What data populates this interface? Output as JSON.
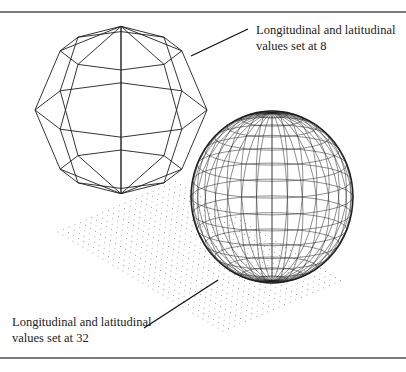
{
  "figure": {
    "rules": {
      "color": "#7d7d7d"
    },
    "callouts": [
      {
        "id": "low-res",
        "lines": [
          "Longitudinal and latitudinal",
          "values set at 8"
        ],
        "leader": {
          "x1": 191,
          "y1": 56,
          "x2": 248,
          "y2": 29
        }
      },
      {
        "id": "high-res",
        "lines": [
          "Longitudinal and latitudinal",
          "values set at 32"
        ],
        "leader": {
          "x1": 144,
          "y1": 328,
          "x2": 218,
          "y2": 280
        }
      }
    ],
    "spheres": [
      {
        "id": "sphere-8",
        "segments": 8,
        "cx": 121,
        "cy": 110,
        "rx": 86,
        "ry": 88,
        "tilt_deg": 18,
        "stroke": "#1e1e1e",
        "width": 0.9
      },
      {
        "id": "sphere-32",
        "segments": 32,
        "cx": 272,
        "cy": 197,
        "rx": 81,
        "ry": 86,
        "tilt_deg": 12,
        "stroke": "#1e1e1e",
        "width": 0.5
      }
    ],
    "dot_grid": {
      "origin": [
        58,
        232
      ],
      "u": [
        5.6,
        -2.4
      ],
      "v": [
        5.0,
        3.0
      ],
      "nu": 22,
      "nv": 34,
      "color": "#9a9a9a"
    }
  }
}
